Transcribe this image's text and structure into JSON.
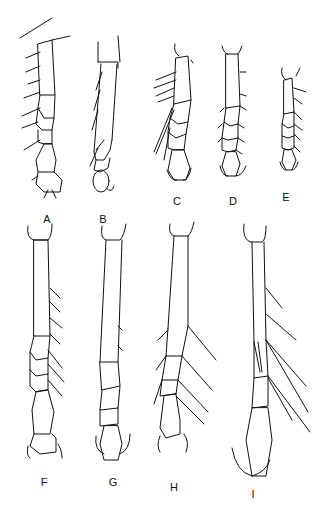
{
  "figure": {
    "background": "#ffffff",
    "ink": "#111111",
    "panels": [
      {
        "label": "A",
        "x": 47,
        "y": 213
      },
      {
        "label": "B",
        "x": 103,
        "y": 213
      },
      {
        "label": "C",
        "x": 177,
        "y": 195
      },
      {
        "label": "D",
        "x": 233,
        "y": 195
      },
      {
        "label": "E",
        "x": 286,
        "y": 191
      },
      {
        "label": "F",
        "x": 44,
        "y": 476
      },
      {
        "label": "G",
        "x": 113,
        "y": 476
      },
      {
        "label": "H",
        "x": 174,
        "y": 481
      },
      {
        "label": "I",
        "x": 253,
        "y": 488
      }
    ]
  }
}
